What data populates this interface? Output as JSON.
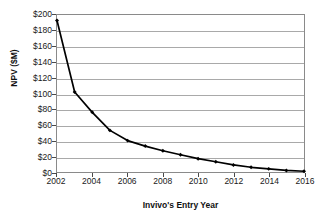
{
  "chart_data": {
    "type": "line",
    "title": "",
    "xlabel": "Invivo's Entry Year",
    "ylabel": "NPV ($M)",
    "x": [
      2002,
      2003,
      2004,
      2005,
      2006,
      2007,
      2008,
      2009,
      2010,
      2011,
      2012,
      2013,
      2014,
      2015,
      2016
    ],
    "values": [
      193,
      102,
      76,
      53,
      40,
      33,
      27,
      22,
      17,
      13,
      9,
      6,
      4,
      2,
      1
    ],
    "series": [
      {
        "name": "NPV",
        "values": [
          193,
          102,
          76,
          53,
          40,
          33,
          27,
          22,
          17,
          13,
          9,
          6,
          4,
          2,
          1
        ]
      }
    ],
    "xlim": [
      2002,
      2016
    ],
    "ylim": [
      0,
      200
    ],
    "y_ticks": [
      0,
      20,
      40,
      60,
      80,
      100,
      120,
      140,
      160,
      180,
      200
    ],
    "y_tick_labels": [
      "$0",
      "$20",
      "$40",
      "$60",
      "$80",
      "$100",
      "$120",
      "$140",
      "$160",
      "$180",
      "$200"
    ],
    "x_ticks": [
      2002,
      2004,
      2006,
      2008,
      2010,
      2012,
      2014,
      2016
    ],
    "x_tick_labels": [
      "2002",
      "2004",
      "2006",
      "2008",
      "2010",
      "2012",
      "2014",
      "2016"
    ],
    "grid": "horizontal",
    "legend": "none",
    "line_color": "#000000",
    "marker": "diamond",
    "marker_color": "#000000",
    "grid_color": "#a9a9a9",
    "frame_color": "#8a8a8a",
    "background_color": "#ffffff"
  }
}
